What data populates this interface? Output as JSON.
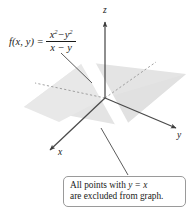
{
  "figure": {
    "background_color": "#ffffff",
    "plane_fill_color": "#e3e3e3",
    "axis_color": "#4d4d4d",
    "excluded_band_color": "#ffffff",
    "callout_border_color": "#9a9a9a",
    "text_color": "#1a1a1a"
  },
  "formula": {
    "lhs": "f(x, y)",
    "equals": "=",
    "numerator_base1": "x",
    "numerator_exp1": "2",
    "numerator_minus": "−",
    "numerator_base2": "y",
    "numerator_exp2": "2",
    "denominator": "x − y",
    "full_text": "f(x, y) = (x² − y²) / (x − y)"
  },
  "axes": {
    "z_label": "z",
    "y_label": "y",
    "x_label": "x",
    "origin": {
      "x": 105,
      "y": 98
    }
  },
  "callout": {
    "line1_prefix": "All points with ",
    "line1_math": "y = x",
    "line2": "are excluded from graph.",
    "full_text": "All points with y = x are excluded from graph."
  }
}
